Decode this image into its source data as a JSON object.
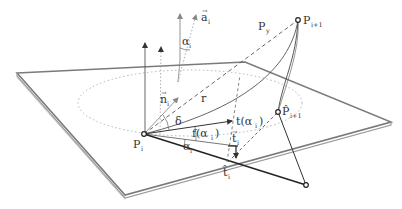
{
  "diagram": {
    "colors": {
      "line": "#333333",
      "plane_edge": "#7a7a7a",
      "plane_fill": "#ffffff",
      "dotted": "#aaaaaa",
      "dashed": "#555555"
    },
    "labels": {
      "a_i": {
        "base": "a",
        "sub": "i",
        "vector": true
      },
      "alpha_i_top": {
        "base": "α",
        "sub": "i"
      },
      "P_y": {
        "base": "P",
        "sub": "y"
      },
      "P_i_plus_1": {
        "base": "P",
        "sub": "i+1"
      },
      "n_i": {
        "base": "n",
        "sub": "i",
        "vector": true
      },
      "r": {
        "base": "r"
      },
      "delta": {
        "base": "δ"
      },
      "t_alpha_i": {
        "base": "t(α",
        "sub": "i",
        "tail": ")"
      },
      "f_alpha_i": {
        "base": "f(α",
        "sub": "i",
        "tail": ")"
      },
      "P_hat_i_plus_1": {
        "base": "P̂",
        "sub": "i+1"
      },
      "t_i": {
        "base": "t",
        "sub": "i",
        "vector": true
      },
      "P_i": {
        "base": "P",
        "sub": "i"
      },
      "alpha_i_bottom": {
        "base": "α",
        "sub": "i"
      },
      "t_hat_i": {
        "base": "t̂",
        "sub": "i"
      }
    }
  }
}
